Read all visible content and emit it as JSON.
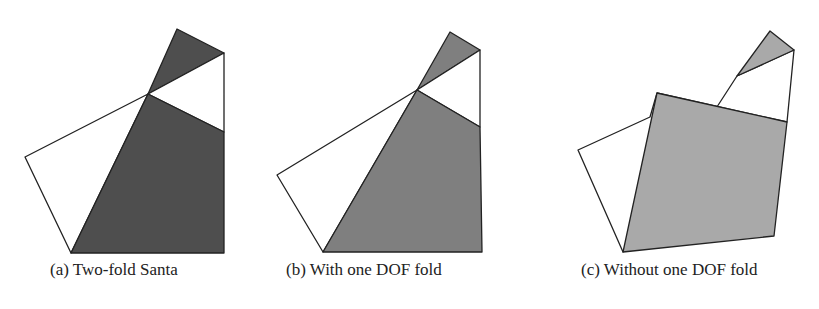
{
  "colors": {
    "dark_fill": "#4e4e4e",
    "medium_fill": "#7f7f7f",
    "light_fill": "#a9a9a9",
    "outline": "#222222",
    "background": "#ffffff"
  },
  "subfigures": [
    {
      "id": "a",
      "caption": "(a) Two-fold Santa",
      "polygons": [
        {
          "role": "top-flap",
          "fill": "dark",
          "points": "177,29 224,53 148,94"
        },
        {
          "role": "upper-white-wedge",
          "fill": "white",
          "points": "148,94 224,53 224,132"
        },
        {
          "role": "left-white-panel",
          "fill": "white",
          "points": "148,94 71,253 25,157"
        },
        {
          "role": "main-body",
          "fill": "dark",
          "points": "148,94 224,132 224,253 71,253"
        }
      ]
    },
    {
      "id": "b",
      "caption": "(b) With one DOF fold",
      "polygons": [
        {
          "role": "top-flap",
          "fill": "medium",
          "points": "450,32 480,50 417,90"
        },
        {
          "role": "upper-white-wedge",
          "fill": "white",
          "points": "417,90 480,50 480,127"
        },
        {
          "role": "left-white-panel",
          "fill": "white",
          "points": "417,90 323,252 277,175"
        },
        {
          "role": "main-body",
          "fill": "medium",
          "points": "417,90 480,127 482,252 323,252"
        }
      ]
    },
    {
      "id": "c",
      "caption": "(c) Without one DOF fold",
      "polygons": [
        {
          "role": "top-flap",
          "fill": "light",
          "points": "770,31 794,50 737,76"
        },
        {
          "role": "white-backing",
          "fill": "white",
          "points": "794,50 787,122 657,93 650,117 578,150 623,252 737,76"
        },
        {
          "role": "folded-square",
          "fill": "light",
          "points": "657,93 787,122 774,236 623,252"
        }
      ]
    }
  ]
}
